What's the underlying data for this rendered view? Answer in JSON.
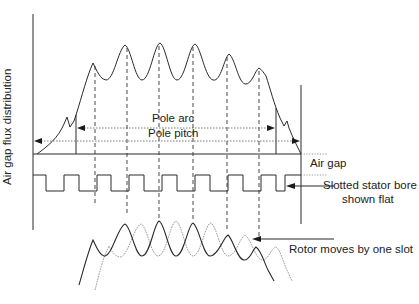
{
  "diagram": {
    "labels": {
      "y_axis": "Air gap flux distribution",
      "pole_arc": "Pole arc",
      "pole_pitch": "Pole pitch",
      "air_gap": "Air gap",
      "stator_line1": "Slotted stator bore",
      "stator_line2": "shown flat",
      "rotor": "Rotor moves by one slot"
    },
    "colors": {
      "line": "#2a2a2a",
      "dashed": "#333333",
      "dotted_curve": "#9a9a9a",
      "background": "#ffffff"
    },
    "geometry": {
      "axis_x": 33,
      "right_x": 301,
      "baseline_y": 154,
      "pole_arc": {
        "x1": 76,
        "x2": 276,
        "y": 128
      },
      "pole_pitch": {
        "x1": 33,
        "x2": 301,
        "y": 141
      },
      "tooth_peaks_x": [
        95,
        127,
        159,
        193,
        227,
        259
      ],
      "stator": {
        "high_y": 175,
        "low_y": 191,
        "x_start": 33,
        "x_end": 301
      }
    }
  }
}
